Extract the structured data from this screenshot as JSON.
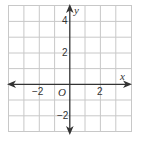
{
  "diagram": {
    "type": "coordinate-plane",
    "grid": {
      "columns": 8,
      "rows": 8,
      "x_min": -4,
      "x_max": 4,
      "y_min": -3,
      "y_max": 5,
      "gridline_color": "#c8c8c8",
      "axis_color": "#333333"
    },
    "axes": {
      "x_label": "x",
      "y_label": "y",
      "origin_label": "O"
    },
    "tick_labels": {
      "x_neg2": "−2",
      "x_pos2": "2",
      "y_pos4": "4",
      "y_pos2": "2",
      "y_neg2": "−2"
    }
  }
}
